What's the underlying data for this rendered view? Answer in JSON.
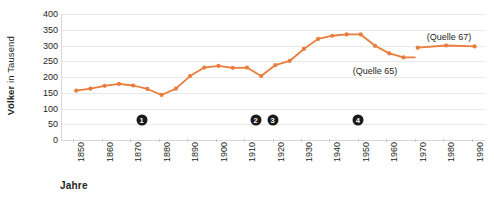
{
  "chart_data": {
    "type": "line",
    "title": "",
    "xlabel": "Jahre",
    "ylabel_strong": "Völker",
    "ylabel_light": " in Tausend",
    "ylabel_full": "Völker in Tausend",
    "xlim": [
      1846,
      1995
    ],
    "ylim": [
      0,
      400
    ],
    "yticks": [
      400,
      350,
      300,
      250,
      200,
      150,
      100,
      50,
      0
    ],
    "xticks": [
      1850,
      1860,
      1870,
      1880,
      1890,
      1900,
      1910,
      1920,
      1930,
      1940,
      1950,
      1960,
      1970,
      1980,
      1990
    ],
    "grid": true,
    "legend_position": "inline-annotation",
    "line_color": "#E87D3C",
    "marker_color": "#E87D3C",
    "grid_color": "#E9E9E9",
    "axis_color": "#D8D8D8",
    "series": [
      {
        "name": "(Quelle 65)",
        "label": "(Quelle 65)",
        "x": [
          1851,
          1856,
          1861,
          1866,
          1871,
          1876,
          1881,
          1886,
          1891,
          1896,
          1901,
          1906,
          1911,
          1916,
          1921,
          1926,
          1931,
          1936,
          1941,
          1946,
          1951,
          1956,
          1961,
          1966,
          1970
        ],
        "values": [
          157,
          163,
          172,
          178,
          173,
          162,
          143,
          163,
          203,
          230,
          235,
          229,
          230,
          203,
          238,
          251,
          289,
          321,
          331,
          335,
          335,
          299,
          275,
          262,
          262
        ],
        "markers_shown": [
          true,
          true,
          true,
          true,
          true,
          true,
          true,
          true,
          true,
          true,
          true,
          true,
          true,
          true,
          true,
          true,
          true,
          true,
          true,
          true,
          true,
          true,
          true,
          true,
          false
        ]
      },
      {
        "name": "(Quelle 67)",
        "label": "(Quelle 67)",
        "x": [
          1971,
          1981,
          1991
        ],
        "values": [
          293,
          300,
          297
        ],
        "markers_shown": [
          true,
          true,
          true
        ]
      }
    ],
    "annotations": [
      {
        "text": "(Quelle 65)",
        "x": 1956,
        "y": 218
      },
      {
        "text": "(Quelle 67)",
        "x": 1982,
        "y": 326
      }
    ],
    "event_markers": [
      {
        "label": "1",
        "glyph": "❶",
        "x": 1874,
        "y": 63
      },
      {
        "label": "2",
        "glyph": "❷",
        "x": 1914,
        "y": 63
      },
      {
        "label": "3",
        "glyph": "❸",
        "x": 1920,
        "y": 63
      },
      {
        "label": "4",
        "glyph": "❹",
        "x": 1950,
        "y": 63
      }
    ]
  }
}
